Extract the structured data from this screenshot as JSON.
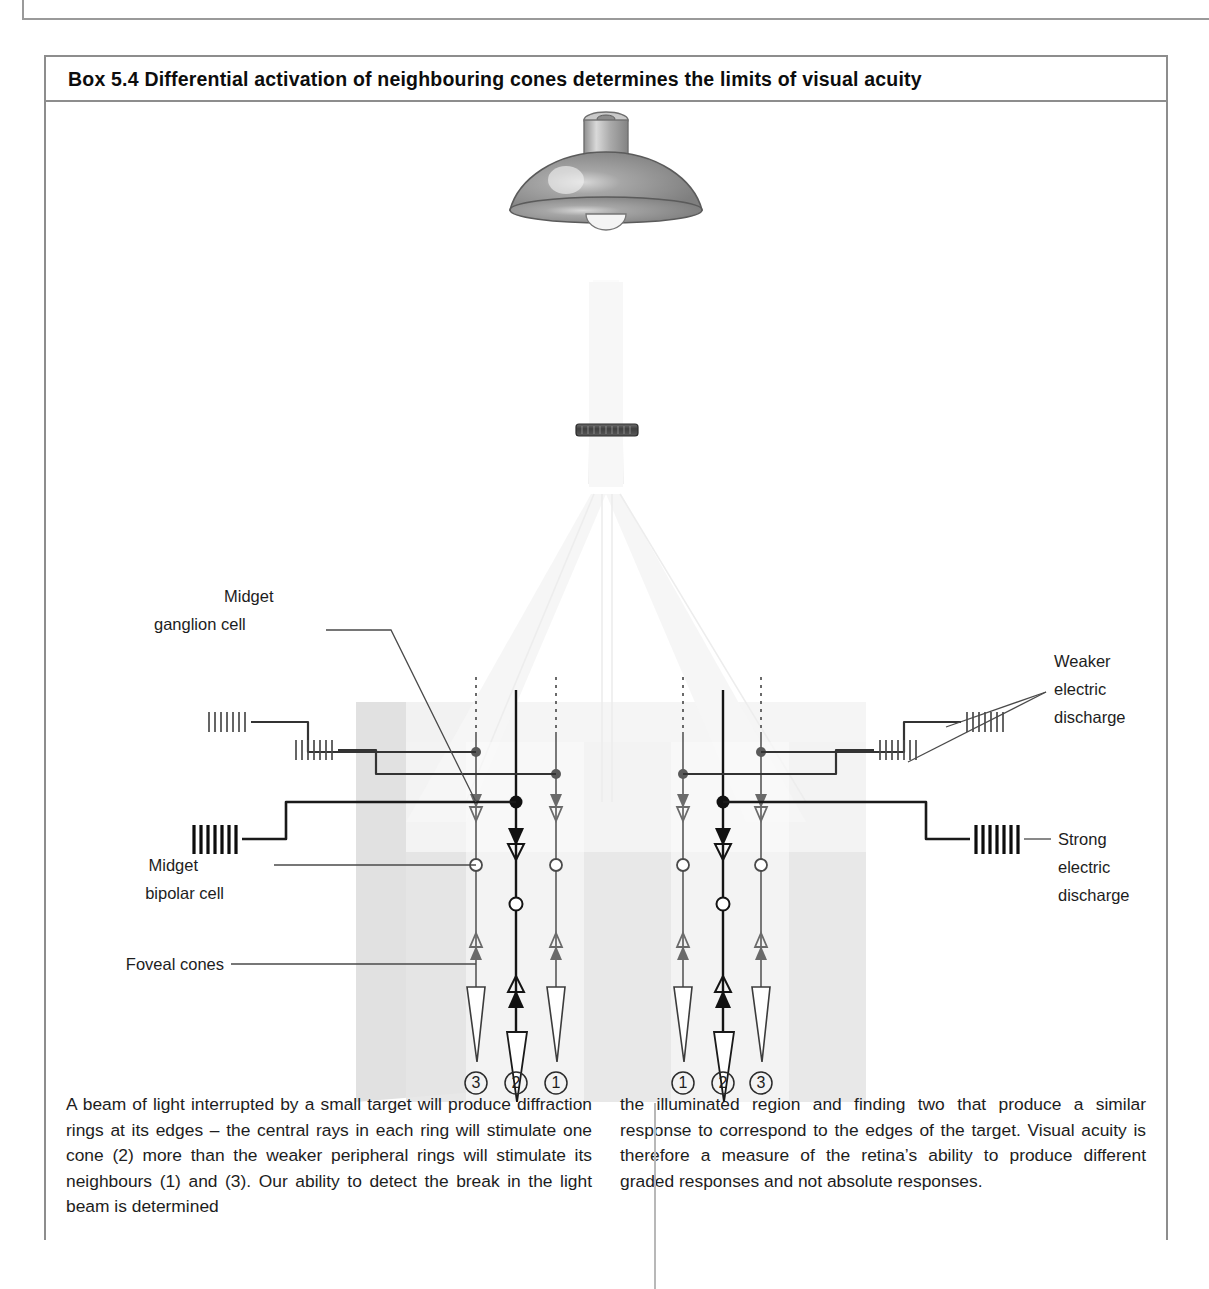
{
  "box": {
    "label": "Box 5.4",
    "title": "Box 5.4   Differential activation of neighbouring cones determines the limits of visual acuity"
  },
  "figure": {
    "labels": {
      "midget_ganglion_cell_line1": "Midget",
      "midget_ganglion_cell_line2": "ganglion cell",
      "midget_bipolar_cell_line1": "Midget",
      "midget_bipolar_cell_line2": "bipolar cell",
      "foveal_cones": "Foveal cones",
      "weaker_line1": "Weaker",
      "weaker_line2": "electric",
      "weaker_line3": "discharge",
      "strong_line1": "Strong",
      "strong_line2": "electric",
      "strong_line3": "discharge"
    },
    "cone_numbers_left": [
      "3",
      "2",
      "1"
    ],
    "cone_numbers_right": [
      "1",
      "2",
      "3"
    ],
    "colors": {
      "ink": "#1d1d1d",
      "strong_trace": "#111111",
      "weak_trace": "#5d5d5d",
      "light_beam": "#f2f2f2",
      "retina_block": "#e4e4e4",
      "retina_side": "#d5d5d5",
      "lamp_shade": "#8e8e8e",
      "lamp_cap": "#b4b4b4",
      "target_bar": "#4a4a4a",
      "outline": "#8d8d8d"
    }
  },
  "caption": {
    "left": "A beam of light interrupted by a small target will produce diffraction rings at its edges – the central rays in each ring will stimulate one cone (2) more than the weaker peripheral rings will stimulate its neighbours (1) and (3). Our ability to detect the break in the light beam is determined",
    "right": "the illuminated region and finding two that produce a similar response to correspond to the edges of the target. Visual acuity is therefore a measure of the retina’s ability to produce different graded responses and not absolute responses."
  }
}
